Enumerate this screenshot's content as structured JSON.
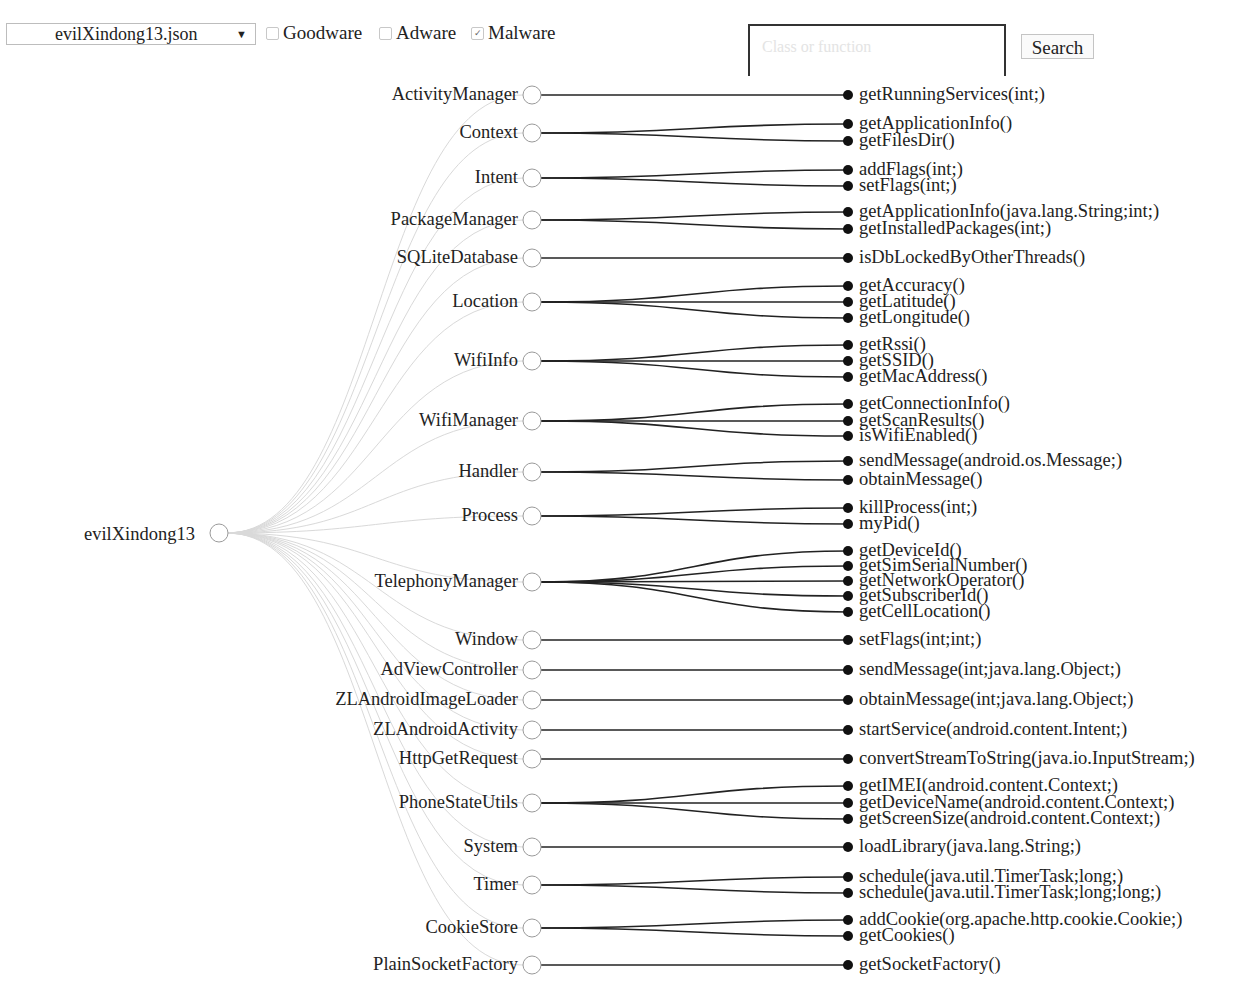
{
  "toolbar": {
    "file_select": {
      "value": "evilXindong13.json",
      "arrow": "▼"
    },
    "filters": [
      {
        "label": "Goodware",
        "checked": false
      },
      {
        "label": "Adware",
        "checked": false
      },
      {
        "label": "Malware",
        "checked": true
      }
    ],
    "search": {
      "placeholder": "Class or function",
      "button_label": "Search"
    }
  },
  "tree": {
    "root": {
      "label": "evilXindong13",
      "x": 219,
      "y": 533
    },
    "colors": {
      "strong_edge": "#222222",
      "faint_edge": "#d9d9d9",
      "class_node_stroke": "#9a9a9a",
      "leaf_fill": "#111111"
    },
    "classes": [
      {
        "label": "ActivityManager",
        "y": 95,
        "methods": [
          {
            "label": "getRunningServices(int;)",
            "y": 95
          }
        ]
      },
      {
        "label": "Context",
        "y": 133,
        "methods": [
          {
            "label": "getApplicationInfo()",
            "y": 124
          },
          {
            "label": "getFilesDir()",
            "y": 141
          }
        ]
      },
      {
        "label": "Intent",
        "y": 178,
        "methods": [
          {
            "label": "addFlags(int;)",
            "y": 170
          },
          {
            "label": "setFlags(int;)",
            "y": 186
          }
        ]
      },
      {
        "label": "PackageManager",
        "y": 220,
        "methods": [
          {
            "label": "getApplicationInfo(java.lang.String;int;)",
            "y": 212
          },
          {
            "label": "getInstalledPackages(int;)",
            "y": 229
          }
        ]
      },
      {
        "label": "SQLiteDatabase",
        "y": 258,
        "methods": [
          {
            "label": "isDbLockedByOtherThreads()",
            "y": 258
          }
        ]
      },
      {
        "label": "Location",
        "y": 302,
        "methods": [
          {
            "label": "getAccuracy()",
            "y": 286
          },
          {
            "label": "getLatitude()",
            "y": 302
          },
          {
            "label": "getLongitude()",
            "y": 318
          }
        ]
      },
      {
        "label": "WifiInfo",
        "y": 361,
        "methods": [
          {
            "label": "getRssi()",
            "y": 345
          },
          {
            "label": "getSSID()",
            "y": 361
          },
          {
            "label": "getMacAddress()",
            "y": 377
          }
        ]
      },
      {
        "label": "WifiManager",
        "y": 421,
        "methods": [
          {
            "label": "getConnectionInfo()",
            "y": 404
          },
          {
            "label": "getScanResults()",
            "y": 421
          },
          {
            "label": "isWifiEnabled()",
            "y": 436
          }
        ]
      },
      {
        "label": "Handler",
        "y": 472,
        "methods": [
          {
            "label": "sendMessage(android.os.Message;)",
            "y": 461
          },
          {
            "label": "obtainMessage()",
            "y": 480
          }
        ]
      },
      {
        "label": "Process",
        "y": 516,
        "methods": [
          {
            "label": "killProcess(int;)",
            "y": 508
          },
          {
            "label": "myPid()",
            "y": 524
          }
        ]
      },
      {
        "label": "TelephonyManager",
        "y": 582,
        "methods": [
          {
            "label": "getDeviceId()",
            "y": 551
          },
          {
            "label": "getSimSerialNumber()",
            "y": 566
          },
          {
            "label": "getNetworkOperator()",
            "y": 581
          },
          {
            "label": "getSubscriberId()",
            "y": 596
          },
          {
            "label": "getCellLocation()",
            "y": 612
          }
        ]
      },
      {
        "label": "Window",
        "y": 640,
        "methods": [
          {
            "label": "setFlags(int;int;)",
            "y": 640
          }
        ]
      },
      {
        "label": "AdViewController",
        "y": 670,
        "methods": [
          {
            "label": "sendMessage(int;java.lang.Object;)",
            "y": 670
          }
        ]
      },
      {
        "label": "ZLAndroidImageLoader",
        "y": 700,
        "methods": [
          {
            "label": "obtainMessage(int;java.lang.Object;)",
            "y": 700
          }
        ]
      },
      {
        "label": "ZLAndroidActivity",
        "y": 730,
        "methods": [
          {
            "label": "startService(android.content.Intent;)",
            "y": 730
          }
        ]
      },
      {
        "label": "HttpGetRequest",
        "y": 759,
        "methods": [
          {
            "label": "convertStreamToString(java.io.InputStream;)",
            "y": 759
          }
        ]
      },
      {
        "label": "PhoneStateUtils",
        "y": 803,
        "methods": [
          {
            "label": "getIMEI(android.content.Context;)",
            "y": 786
          },
          {
            "label": "getDeviceName(android.content.Context;)",
            "y": 803
          },
          {
            "label": "getScreenSize(android.content.Context;)",
            "y": 819
          }
        ]
      },
      {
        "label": "System",
        "y": 847,
        "methods": [
          {
            "label": "loadLibrary(java.lang.String;)",
            "y": 847
          }
        ]
      },
      {
        "label": "Timer",
        "y": 885,
        "methods": [
          {
            "label": "schedule(java.util.TimerTask;long;)",
            "y": 877
          },
          {
            "label": "schedule(java.util.TimerTask;long;long;)",
            "y": 893
          }
        ]
      },
      {
        "label": "CookieStore",
        "y": 928,
        "methods": [
          {
            "label": "addCookie(org.apache.http.cookie.Cookie;)",
            "y": 920
          },
          {
            "label": "getCookies()",
            "y": 936
          }
        ]
      },
      {
        "label": "PlainSocketFactory",
        "y": 965,
        "methods": [
          {
            "label": "getSocketFactory()",
            "y": 965
          }
        ]
      }
    ]
  }
}
